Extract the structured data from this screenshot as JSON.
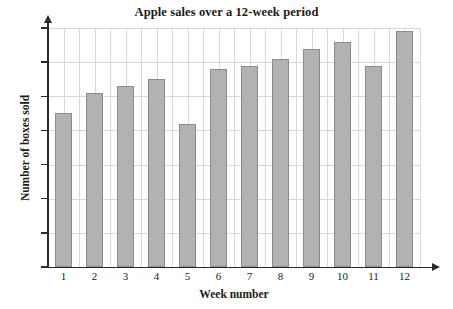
{
  "chart_data": {
    "type": "bar",
    "title": "Apple sales over a 12-week period",
    "xlabel": "Week number",
    "ylabel": "Number of boxes sold",
    "categories": [
      "1",
      "2",
      "3",
      "4",
      "5",
      "6",
      "7",
      "8",
      "9",
      "10",
      "11",
      "12"
    ],
    "values": [
      45,
      51,
      53,
      55,
      42,
      58,
      59,
      61,
      64,
      66,
      59,
      69
    ],
    "ylim": [
      0,
      70
    ],
    "ytick_labels": [
      "0",
      "10",
      "20",
      "30",
      "40",
      "50",
      "60",
      "70"
    ],
    "ytick_values": [
      0,
      10,
      20,
      30,
      40,
      50,
      60,
      70
    ],
    "grid": true,
    "legend": "none",
    "bar_fill_color": "#b2b2b2",
    "bar_border_color": "#8c8c8c",
    "grid_color": "#d9d9d9",
    "axis_color": "#2b2b2b"
  }
}
